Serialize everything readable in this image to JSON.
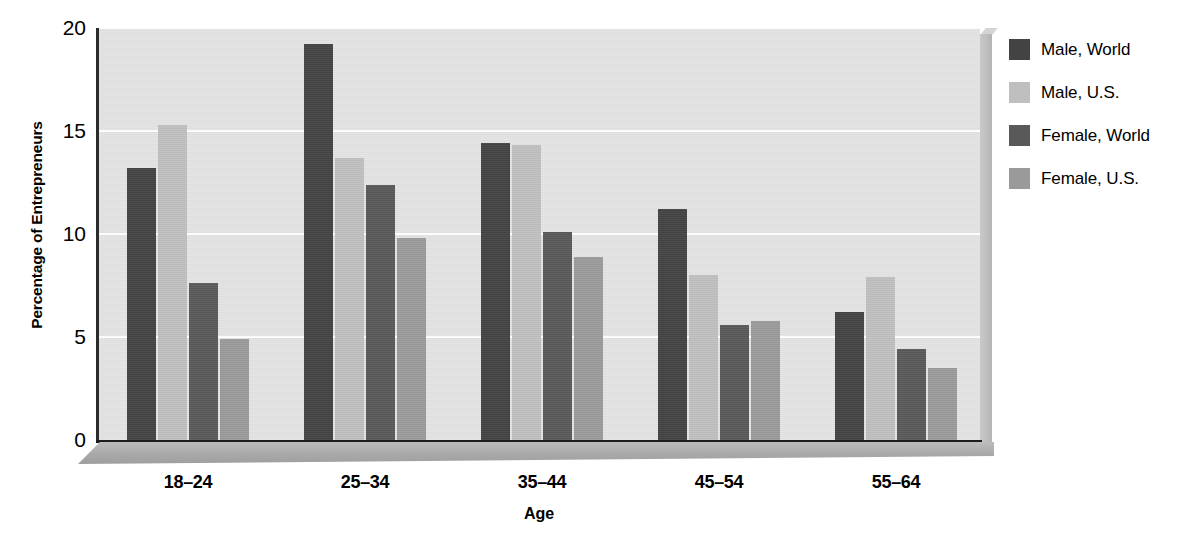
{
  "chart_data": {
    "type": "bar",
    "title": "",
    "xlabel": "Age",
    "ylabel": "Percentage of Entrepreneurs",
    "categories": [
      "18–24",
      "25–34",
      "35–44",
      "45–54",
      "55–64"
    ],
    "ylim": [
      0,
      20
    ],
    "yticks": [
      "0",
      "5",
      "10",
      "15",
      "20"
    ],
    "ytick_values": [
      0,
      5,
      10,
      15,
      20
    ],
    "grid": "horizontal",
    "legend_position": "right",
    "series": [
      {
        "name": "Male, World",
        "color": "#434343",
        "values": [
          13.2,
          19.2,
          14.4,
          11.2,
          6.2
        ]
      },
      {
        "name": "Male, U.S.",
        "color": "#bfbfbf",
        "values": [
          15.3,
          13.7,
          14.3,
          8.0,
          7.9
        ]
      },
      {
        "name": "Female, World",
        "color": "#595959",
        "values": [
          7.6,
          12.4,
          10.1,
          5.6,
          4.4
        ]
      },
      {
        "name": "Female, U.S.",
        "color": "#9a9a9a",
        "values": [
          4.9,
          9.8,
          8.9,
          5.8,
          3.5
        ]
      }
    ],
    "plot_background": "#e3e3e3",
    "gridline_color": "#ffffff",
    "axis_color": "#1c1c1c"
  }
}
